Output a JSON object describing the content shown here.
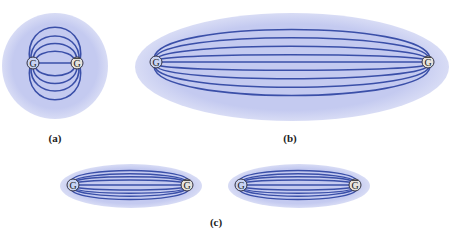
{
  "figure": {
    "panels": [
      {
        "id": "a",
        "label": "(a)",
        "shape": "circle",
        "left_particle": "G",
        "right_particle": "G̅"
      },
      {
        "id": "b",
        "label": "(b)",
        "shape": "long-ellipse",
        "left_particle": "G",
        "right_particle": "G̅"
      },
      {
        "id": "c",
        "label": "(c)",
        "shape": "two-thin-ellipses",
        "left_particle": "G",
        "right_particle": "G̅"
      }
    ],
    "colors": {
      "field_fill": "#c8cdf0",
      "field_line": "#3a4fa8",
      "gluon_fill": "#c9d3f2",
      "antigluon_fill": "#e6e2dc",
      "particle_stroke": "#333344"
    },
    "particle_symbol": "G",
    "antiparticle_symbol": "G",
    "caption": ""
  }
}
